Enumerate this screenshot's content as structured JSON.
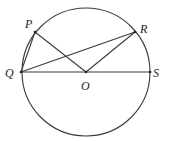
{
  "diagram": {
    "circle": {
      "center": "O"
    },
    "points": {
      "P": {
        "label": "P"
      },
      "Q": {
        "label": "Q"
      },
      "R": {
        "label": "R"
      },
      "S": {
        "label": "S"
      },
      "O": {
        "label": "O"
      }
    },
    "segments": [
      {
        "from": "Q",
        "to": "S",
        "name": "diameter-QS"
      },
      {
        "from": "Q",
        "to": "P",
        "name": "chord-QP"
      },
      {
        "from": "P",
        "to": "O",
        "name": "radius-OP"
      },
      {
        "from": "Q",
        "to": "R",
        "name": "chord-QR"
      },
      {
        "from": "R",
        "to": "O",
        "name": "radius-OR"
      }
    ],
    "colors": {
      "line": "#3a3a3a",
      "text": "#222222",
      "background": "#ffffff"
    }
  }
}
